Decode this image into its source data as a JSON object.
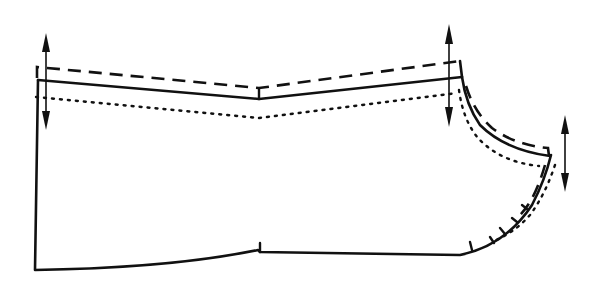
{
  "diagram": {
    "legend": {
      "solid": "pattern outline",
      "dashed": "lengthened line",
      "dotted": "shortened line"
    },
    "arrows": [
      {
        "name": "left-grain-adjust-arrow",
        "direction": "vertical double-headed"
      },
      {
        "name": "center-grain-adjust-arrow",
        "direction": "vertical double-headed"
      },
      {
        "name": "right-grain-adjust-arrow",
        "direction": "vertical double-headed"
      }
    ],
    "colors": {
      "ink": "#111111",
      "paper": "#ffffff"
    }
  }
}
